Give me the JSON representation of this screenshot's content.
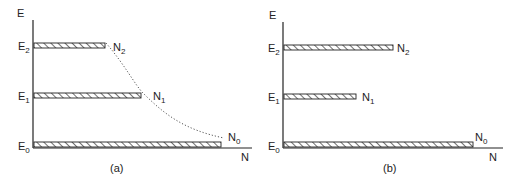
{
  "panels": [
    {
      "id": "a",
      "caption": "(a)",
      "y_axis_label": "E",
      "x_axis_label": "N",
      "levels": [
        {
          "energy": "E",
          "energy_sub": "2",
          "population": "N",
          "population_sub": "2",
          "bar_length": 71
        },
        {
          "energy": "E",
          "energy_sub": "1",
          "population": "N",
          "population_sub": "1",
          "bar_length": 107
        },
        {
          "energy": "E",
          "energy_sub": "0",
          "population": "N",
          "population_sub": "0",
          "bar_length": 187
        }
      ],
      "curve": "dotted exponential decay connecting N2, N1, N0"
    },
    {
      "id": "b",
      "caption": "(b)",
      "y_axis_label": "E",
      "x_axis_label": "N",
      "levels": [
        {
          "energy": "E",
          "energy_sub": "2",
          "population": "N",
          "population_sub": "2",
          "bar_length": 109
        },
        {
          "energy": "E",
          "energy_sub": "1",
          "population": "N",
          "population_sub": "1",
          "bar_length": 72
        },
        {
          "energy": "E",
          "energy_sub": "0",
          "population": "N",
          "population_sub": "0",
          "bar_length": 189
        }
      ]
    }
  ],
  "colors": {
    "line": "#222222",
    "hatch": "#333333",
    "background": "#ffffff"
  }
}
